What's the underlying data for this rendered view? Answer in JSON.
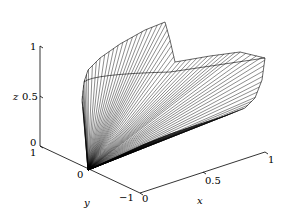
{
  "chart_data": {
    "type": "surface3d",
    "title": "",
    "xlabel": "x",
    "ylabel": "y",
    "zlabel": "z",
    "xlim": [
      0,
      1
    ],
    "ylim": [
      -1,
      1
    ],
    "zlim": [
      0,
      1
    ],
    "x_ticks": [
      "0",
      "0.5",
      "1"
    ],
    "y_ticks": [
      "1",
      "0",
      "-1"
    ],
    "z_ticks": [
      "0",
      "0.5",
      "1"
    ],
    "grid": false,
    "legend": null,
    "line_color": "#000000",
    "num_generators": 40
  },
  "axes": {
    "x": {
      "label": "x",
      "ticks": [
        {
          "v": "0"
        },
        {
          "v": "0.5"
        },
        {
          "v": "1"
        }
      ]
    },
    "y": {
      "label": "y",
      "ticks": [
        {
          "v": "1"
        },
        {
          "v": "0"
        },
        {
          "v": "−1"
        }
      ]
    },
    "z": {
      "label": "z",
      "ticks": [
        {
          "v": "0"
        },
        {
          "v": "0.5"
        },
        {
          "v": "1"
        }
      ]
    }
  }
}
